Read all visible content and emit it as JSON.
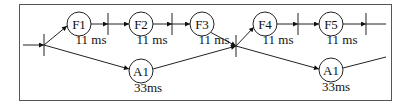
{
  "diagram": {
    "nodes": [
      {
        "id": "F1",
        "label": "F1",
        "time": "11 ms"
      },
      {
        "id": "F2",
        "label": "F2",
        "time": "11 ms"
      },
      {
        "id": "F3",
        "label": "F3",
        "time": "11 ms"
      },
      {
        "id": "F4",
        "label": "F4",
        "time": "11 ms"
      },
      {
        "id": "F5",
        "label": "F5",
        "time": "11 ms"
      },
      {
        "id": "A1a",
        "label": "A1",
        "time": "33ms"
      },
      {
        "id": "A1b",
        "label": "A1",
        "time": "33ms"
      }
    ],
    "colors": {
      "stroke": "#222222",
      "background": "#ffffff",
      "frame": "#555555"
    }
  }
}
